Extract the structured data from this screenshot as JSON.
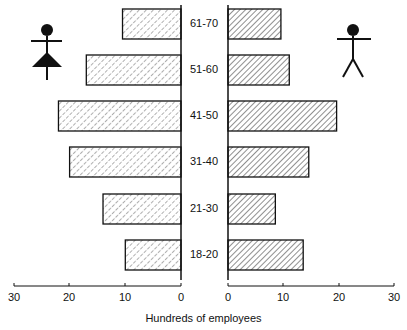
{
  "chart_data": {
    "type": "bar",
    "orientation": "horizontal",
    "layout": "population-pyramid",
    "title": "",
    "xlabel": "Hundreds of employees",
    "ylabel": "",
    "categories": [
      "61-70",
      "51-60",
      "41-50",
      "31-40",
      "21-30",
      "18-20"
    ],
    "series": [
      {
        "name": "Female",
        "side": "left",
        "icon": "female-figure",
        "values": [
          10.5,
          17,
          22,
          20,
          14,
          10
        ]
      },
      {
        "name": "Male",
        "side": "right",
        "icon": "male-figure",
        "values": [
          9.5,
          11,
          19.5,
          14.5,
          8.5,
          13.5
        ]
      }
    ],
    "x_ticks_left": [
      "30",
      "20",
      "10",
      "0"
    ],
    "x_ticks_right": [
      "0",
      "10",
      "20",
      "30"
    ],
    "xlim": [
      0,
      30
    ],
    "grid": false,
    "legend": "pictogram icons (female top-left, male top-right)"
  },
  "colors": {
    "stroke": "#111111",
    "background": "#ffffff"
  }
}
